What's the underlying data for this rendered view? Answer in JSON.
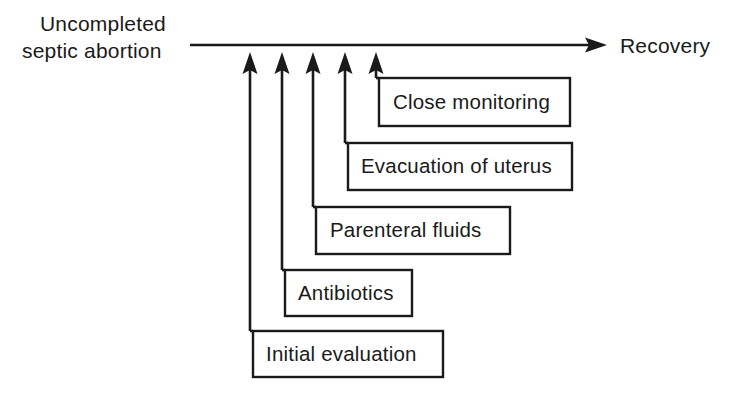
{
  "diagram": {
    "type": "flow-ladder",
    "start_label": {
      "line1": "Uncompleted",
      "line2": "septic abortion"
    },
    "end_label": "Recovery",
    "colors": {
      "ink": "#1a1a1a",
      "background": "#ffffff"
    },
    "main_axis": {
      "x_start": 190,
      "x_end": 607,
      "y": 45,
      "arrow_direction": "right"
    },
    "steps": [
      {
        "order": 1,
        "label": "Initial evaluation",
        "box": {
          "x": 253,
          "y": 331,
          "width": 190,
          "height": 46
        },
        "arrow": {
          "x": 250,
          "tip_y": 52,
          "base_y": 331
        }
      },
      {
        "order": 2,
        "label": "Antibiotics",
        "box": {
          "x": 285,
          "y": 270,
          "width": 127,
          "height": 46
        },
        "arrow": {
          "x": 282,
          "tip_y": 52,
          "base_y": 270
        }
      },
      {
        "order": 3,
        "label": "Parenteral fluids",
        "box": {
          "x": 316,
          "y": 207,
          "width": 194,
          "height": 47
        },
        "arrow": {
          "x": 313,
          "tip_y": 52,
          "base_y": 207
        }
      },
      {
        "order": 4,
        "label": "Evacuation of uterus",
        "box": {
          "x": 348,
          "y": 143,
          "width": 224,
          "height": 47
        },
        "arrow": {
          "x": 345,
          "tip_y": 52,
          "base_y": 143
        }
      },
      {
        "order": 5,
        "label": "Close monitoring",
        "box": {
          "x": 379,
          "y": 78,
          "width": 191,
          "height": 48
        },
        "arrow": {
          "x": 376,
          "tip_y": 52,
          "base_y": 78
        }
      }
    ]
  }
}
